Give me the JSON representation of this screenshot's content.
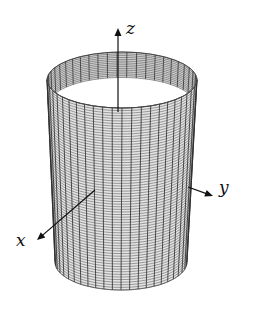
{
  "figure": {
    "surface": {
      "type": "elliptic-cylinder",
      "mesh_color": "#555555",
      "top_ellipse": {
        "cx": 122,
        "cy": 80,
        "rx": 75,
        "ry": 28
      },
      "bottom_ellipse": {
        "cx": 121,
        "cy": 262,
        "rx": 66,
        "ry": 28
      },
      "vertical_lines": 24,
      "horizontal_lines": 70
    },
    "axes": {
      "z": {
        "label": "z",
        "from": [
          118,
          112
        ],
        "to": [
          118,
          28
        ],
        "label_pos": [
          126,
          34
        ]
      },
      "y": {
        "label": "y",
        "from": [
          188,
          187
        ],
        "to": [
          213,
          196
        ],
        "label_pos": [
          219,
          193
        ]
      },
      "x": {
        "label": "x",
        "from": [
          95,
          190
        ],
        "to": [
          37,
          240
        ],
        "label_pos": [
          16,
          246
        ]
      }
    },
    "axis_color": "#111111"
  }
}
